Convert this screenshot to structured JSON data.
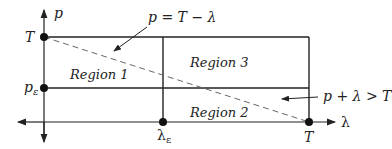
{
  "diagram": {
    "axes": {
      "y_label": "p",
      "x_label": "λ"
    },
    "ticks": {
      "y_top": "T",
      "y_mid_base": "p",
      "y_mid_sub": "ε",
      "x_mid_base": "λ",
      "x_mid_sub": "ε",
      "x_right": "T"
    },
    "regions": {
      "r1": "Region 1",
      "r2": "Region 2",
      "r3": "Region 3"
    },
    "annotations": {
      "line_eq": "p = T − λ",
      "inequality": "p + λ > T"
    },
    "colors": {
      "line": "#222222",
      "dashed": "#555555"
    }
  }
}
